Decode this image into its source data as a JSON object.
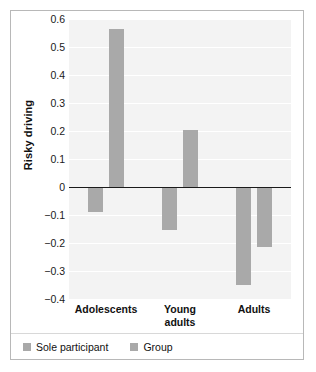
{
  "chart_data": {
    "type": "bar",
    "title": "",
    "xlabel": "",
    "ylabel": "Risky driving",
    "ylim": [
      -0.4,
      0.6
    ],
    "grid": true,
    "legend_position": "bottom-left",
    "categories": [
      "Adolescents",
      "Young\nadults",
      "Adults"
    ],
    "category_labels_flat": [
      "Adolescents",
      "Young adults",
      "Adults"
    ],
    "yticks": [
      "0.6",
      "0.5",
      "0.4",
      "0.3",
      "0.2",
      "0.1",
      "0",
      "-0.1",
      "-0.2",
      "-0.3",
      "-0.4"
    ],
    "ytick_values": [
      0.6,
      0.5,
      0.4,
      0.3,
      0.2,
      0.1,
      0,
      -0.1,
      -0.2,
      -0.3,
      -0.4
    ],
    "series": [
      {
        "name": "Sole participant",
        "color": "#a9a9a9",
        "values": [
          -0.09,
          -0.155,
          -0.35
        ]
      },
      {
        "name": "Group",
        "color": "#a9a9a9",
        "values": [
          0.565,
          0.205,
          -0.215
        ]
      }
    ]
  },
  "axis": {
    "y_title": "Risky driving"
  },
  "legend": {
    "items": [
      {
        "label": "Sole participant",
        "color": "#a9a9a9"
      },
      {
        "label": "Group",
        "color": "#a9a9a9"
      }
    ]
  },
  "colors": {
    "bar": "#a9a9a9",
    "plot_background": "#f3f3f3",
    "gridline": "#ffffff",
    "axis_line": "#1a1a1a",
    "card_border": "#b8b8b8"
  }
}
